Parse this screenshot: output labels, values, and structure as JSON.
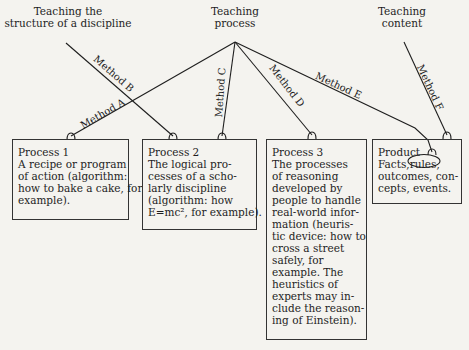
{
  "sources": {
    "structure": [
      "Teaching the",
      "structure of a discipline"
    ],
    "process": [
      "Teaching",
      "process"
    ],
    "content": [
      "Teaching",
      "content"
    ]
  },
  "methods": {
    "a": "Method A",
    "b": "Method B",
    "c": "Method C",
    "d": "Method D",
    "e": "Method E",
    "f": "Method F"
  },
  "boxes": {
    "process1": {
      "title": "Process 1",
      "lines": [
        "A recipe or program",
        "of action (algorithm:",
        "how to bake a cake, for",
        "example)."
      ]
    },
    "process2": {
      "title": "Process 2",
      "lines": [
        "The logical pro-",
        "cesses of a scho-",
        "larly discipline",
        "(algorithm: how",
        "E=mc², for example)."
      ]
    },
    "process3": {
      "title": "Process 3",
      "lines": [
        "The processes",
        "of reasoning",
        "developed by",
        "people to handle",
        "real-world infor-",
        "mation (heuris-",
        "tic device: how to",
        "cross a street",
        "safely, for",
        "example. The",
        "heuristics of",
        "experts may in-",
        "clude the reason-",
        "ing of Einstein)."
      ]
    },
    "product": {
      "title": "Product",
      "facts": "Facts,",
      "circled_word": "rules,",
      "lines": [
        "outcomes, con-",
        "cepts, events."
      ]
    }
  }
}
